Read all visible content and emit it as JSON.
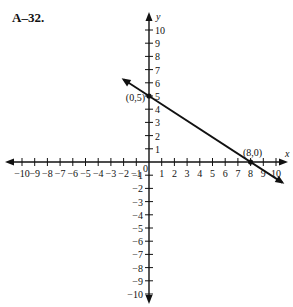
{
  "header": {
    "label": "A–32."
  },
  "chart_data": {
    "type": "line",
    "title": "A–32.",
    "xlabel": "x",
    "ylabel": "y",
    "xlim": [
      -10,
      10
    ],
    "ylim": [
      -10,
      10
    ],
    "x_ticks": [
      -10,
      -9,
      -8,
      -7,
      -6,
      -5,
      -4,
      -3,
      -2,
      -1,
      0,
      1,
      2,
      3,
      4,
      5,
      6,
      7,
      8,
      9,
      10
    ],
    "y_ticks": [
      -10,
      -9,
      -8,
      -7,
      -6,
      -5,
      -4,
      -3,
      -2,
      -1,
      1,
      2,
      3,
      4,
      5,
      6,
      7,
      8,
      9,
      10
    ],
    "grid": false,
    "series": [
      {
        "name": "line",
        "equation": "y = -5/8 x + 5",
        "x": [
          -2,
          10.5
        ],
        "y": [
          6.25,
          -1.5625
        ]
      }
    ],
    "points": [
      {
        "x": 0,
        "y": 5,
        "label": "(0,5)"
      },
      {
        "x": 8,
        "y": 0,
        "label": "(8,0)"
      }
    ]
  }
}
